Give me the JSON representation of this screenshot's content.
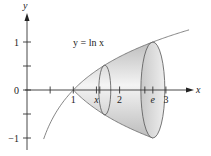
{
  "figure": {
    "type": "solid of revolution diagram",
    "curve_label": "y = ln x",
    "axes": {
      "x_label": "x",
      "y_label": "y",
      "x_ticks": [
        {
          "value": 0.5,
          "label": ""
        },
        {
          "value": 1,
          "label": "1"
        },
        {
          "value": 1.5,
          "label": "x"
        },
        {
          "value": 2,
          "label": "2"
        },
        {
          "value": 2.718,
          "label": "e"
        },
        {
          "value": 3,
          "label": "3"
        }
      ],
      "y_ticks": [
        {
          "value": 1,
          "label": "1"
        },
        {
          "value": 0.5,
          "label": ""
        },
        {
          "value": 0,
          "label": "0"
        },
        {
          "value": -0.5,
          "label": ""
        },
        {
          "value": -1,
          "label": "−1"
        }
      ],
      "x_range": [
        0,
        3.6
      ],
      "y_range": [
        -1.2,
        1.4
      ]
    },
    "solid": {
      "rotated_about": "x-axis",
      "from_x": 1,
      "to_x": 2.718,
      "cross_section_x": 1.68,
      "fill_color": "#d8d8d8",
      "edge_color": "#555555"
    }
  }
}
